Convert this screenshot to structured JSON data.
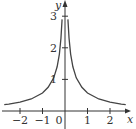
{
  "chart_data": {
    "type": "line",
    "title": "",
    "xlabel": "x",
    "ylabel": "y",
    "xlim": [
      -2.8,
      2.8
    ],
    "ylim": [
      0,
      3.4
    ],
    "grid": false,
    "legend": null,
    "x_ticks": [
      -2,
      -1,
      0,
      1,
      2
    ],
    "x_tick_labels": [
      "−2",
      "−1",
      "0",
      "1",
      "2"
    ],
    "y_ticks": [
      1,
      2,
      3
    ],
    "y_tick_labels": [
      "1",
      "2",
      "3"
    ],
    "series": [
      {
        "name": "curve",
        "description": "symmetric about y-axis, rising steeply toward y-axis, decaying toward 0 as |x| grows",
        "x": [
          -2.7,
          -2.5,
          -2,
          -1.5,
          -1,
          -0.75,
          -0.5,
          -0.35,
          -0.25,
          -0.18,
          -0.13,
          0.13,
          0.18,
          0.25,
          0.35,
          0.5,
          0.75,
          1,
          1.5,
          2,
          2.5,
          2.7
        ],
        "y": [
          0.2,
          0.22,
          0.28,
          0.38,
          0.57,
          0.75,
          1.05,
          1.4,
          1.8,
          2.3,
          2.9,
          2.9,
          2.3,
          1.8,
          1.4,
          1.05,
          0.75,
          0.57,
          0.38,
          0.28,
          0.22,
          0.2
        ]
      }
    ],
    "colors": {
      "curve": "#444444",
      "axes": "#333333"
    }
  }
}
